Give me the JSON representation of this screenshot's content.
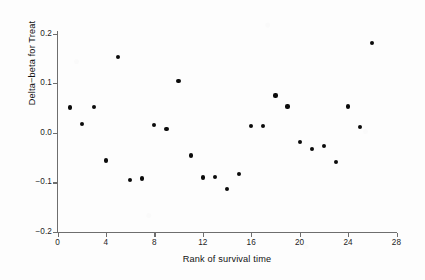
{
  "chart_data": {
    "type": "scatter",
    "title": "",
    "xlabel": "Rank of survival time",
    "ylabel": "Delta−beta for Treat",
    "xlim": [
      0,
      28
    ],
    "ylim": [
      -0.2,
      0.2
    ],
    "xticks": [
      0,
      4,
      8,
      12,
      16,
      20,
      24,
      28
    ],
    "xtick_labels": [
      "0",
      "4",
      "8",
      "12",
      "16",
      "20",
      "24",
      "28"
    ],
    "yticks": [
      0.2,
      0.1,
      0.0,
      -0.1,
      -0.2
    ],
    "ytick_labels": [
      "0.2",
      "0.1",
      "0.0",
      "-0.1",
      "-0.2"
    ],
    "grid": false,
    "legend": null,
    "marker": "filled-circle",
    "marker_color": "#0b0b0b",
    "x": [
      1,
      2,
      3,
      4,
      5,
      6,
      7,
      8,
      9,
      10,
      11,
      12,
      13,
      14,
      15,
      16,
      17,
      18,
      19,
      20,
      21,
      22,
      23,
      24,
      25,
      26
    ],
    "y": [
      0.051,
      0.018,
      0.052,
      -0.056,
      0.152,
      -0.096,
      -0.092,
      0.016,
      0.008,
      0.104,
      -0.046,
      -0.09,
      -0.089,
      -0.113,
      -0.083,
      0.013,
      0.014,
      0.075,
      0.053,
      -0.018,
      -0.033,
      -0.026,
      -0.059,
      0.053,
      0.011,
      0.181
    ],
    "points": [
      {
        "rank": 1,
        "value": 0.051
      },
      {
        "rank": 2,
        "value": 0.018
      },
      {
        "rank": 3,
        "value": 0.052
      },
      {
        "rank": 4,
        "value": -0.056
      },
      {
        "rank": 5,
        "value": 0.152
      },
      {
        "rank": 6,
        "value": -0.096
      },
      {
        "rank": 7,
        "value": -0.092
      },
      {
        "rank": 8,
        "value": 0.016
      },
      {
        "rank": 9,
        "value": 0.008
      },
      {
        "rank": 10,
        "value": 0.104
      },
      {
        "rank": 11,
        "value": -0.046
      },
      {
        "rank": 12,
        "value": -0.09
      },
      {
        "rank": 13,
        "value": -0.089
      },
      {
        "rank": 14,
        "value": -0.113
      },
      {
        "rank": 15,
        "value": -0.083
      },
      {
        "rank": 16,
        "value": 0.013
      },
      {
        "rank": 17,
        "value": 0.014
      },
      {
        "rank": 18,
        "value": 0.075
      },
      {
        "rank": 19,
        "value": 0.053
      },
      {
        "rank": 20,
        "value": -0.018
      },
      {
        "rank": 21,
        "value": -0.033
      },
      {
        "rank": 22,
        "value": -0.026
      },
      {
        "rank": 23,
        "value": -0.059
      },
      {
        "rank": 24,
        "value": 0.053
      },
      {
        "rank": 25,
        "value": 0.011
      },
      {
        "rank": 26,
        "value": 0.181
      }
    ]
  },
  "axes": {
    "x_title": "Rank of survival time",
    "y_title": "Delta−beta for Treat"
  },
  "colors": {
    "axis": "#6e6e6e",
    "text": "#121212",
    "marker": "#0b0b0b",
    "background": "#fdfdfd"
  }
}
